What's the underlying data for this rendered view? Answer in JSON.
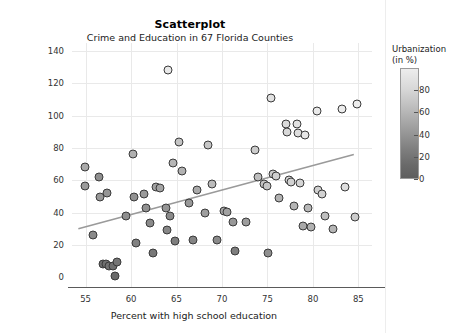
{
  "chart_data": {
    "type": "scatter",
    "title": "Scatterplot",
    "subtitle": "Crime and Education in 67 Florida Counties",
    "xlabel": "Percent with high school education",
    "ylabel": "Crimes per thousand",
    "xlim": [
      53.5,
      86.5
    ],
    "ylim": [
      -6,
      145
    ],
    "xticks": [
      55,
      60,
      65,
      70,
      75,
      80,
      85
    ],
    "yticks": [
      0,
      20,
      40,
      60,
      80,
      100,
      120,
      140
    ],
    "grid": true,
    "legend": {
      "title_line1": "Urbanization",
      "title_line2": "(in %)",
      "position": "right",
      "type": "colorbar",
      "ticks": [
        0,
        20,
        40,
        60,
        80
      ],
      "vmin": 0,
      "vmax": 100,
      "low_color": "#5e5e5e",
      "high_color": "#ededed"
    },
    "fit_line": {
      "x": [
        54.2,
        84.5
      ],
      "y": [
        30.0,
        76.0
      ],
      "color": "#9a9a9a"
    },
    "point_color_variable": "urbanization",
    "points": [
      {
        "x": 54.9,
        "y": 68.0,
        "u": 52
      },
      {
        "x": 54.9,
        "y": 56.5,
        "u": 42
      },
      {
        "x": 55.8,
        "y": 26.0,
        "u": 30
      },
      {
        "x": 56.5,
        "y": 62.0,
        "u": 34
      },
      {
        "x": 56.6,
        "y": 50.0,
        "u": 40
      },
      {
        "x": 56.9,
        "y": 8.0,
        "u": 10
      },
      {
        "x": 57.2,
        "y": 8.0,
        "u": 12
      },
      {
        "x": 57.3,
        "y": 52.0,
        "u": 38
      },
      {
        "x": 57.6,
        "y": 7.0,
        "u": 14
      },
      {
        "x": 58.0,
        "y": 7.0,
        "u": 12
      },
      {
        "x": 58.2,
        "y": 1.0,
        "u": 8
      },
      {
        "x": 58.4,
        "y": 9.5,
        "u": 16
      },
      {
        "x": 59.4,
        "y": 38.0,
        "u": 34
      },
      {
        "x": 60.2,
        "y": 76.0,
        "u": 56
      },
      {
        "x": 60.3,
        "y": 50.0,
        "u": 36
      },
      {
        "x": 60.5,
        "y": 21.0,
        "u": 24
      },
      {
        "x": 61.4,
        "y": 51.5,
        "u": 42
      },
      {
        "x": 61.6,
        "y": 43.0,
        "u": 35
      },
      {
        "x": 62.1,
        "y": 33.5,
        "u": 30
      },
      {
        "x": 62.4,
        "y": 15.0,
        "u": 18
      },
      {
        "x": 62.7,
        "y": 56.0,
        "u": 46
      },
      {
        "x": 63.2,
        "y": 55.5,
        "u": 48
      },
      {
        "x": 63.8,
        "y": 43.0,
        "u": 38
      },
      {
        "x": 63.9,
        "y": 29.0,
        "u": 28
      },
      {
        "x": 64.1,
        "y": 128.0,
        "u": 96
      },
      {
        "x": 64.3,
        "y": 38.0,
        "u": 30
      },
      {
        "x": 64.6,
        "y": 71.0,
        "u": 60
      },
      {
        "x": 64.8,
        "y": 22.5,
        "u": 22
      },
      {
        "x": 65.3,
        "y": 84.0,
        "u": 70
      },
      {
        "x": 65.6,
        "y": 66.0,
        "u": 58
      },
      {
        "x": 66.4,
        "y": 46.0,
        "u": 40
      },
      {
        "x": 66.8,
        "y": 23.0,
        "u": 26
      },
      {
        "x": 67.3,
        "y": 54.0,
        "u": 52
      },
      {
        "x": 68.1,
        "y": 40.0,
        "u": 44
      },
      {
        "x": 68.5,
        "y": 82.0,
        "u": 72
      },
      {
        "x": 68.9,
        "y": 58.0,
        "u": 64
      },
      {
        "x": 69.5,
        "y": 23.0,
        "u": 30
      },
      {
        "x": 70.2,
        "y": 41.0,
        "u": 48
      },
      {
        "x": 70.6,
        "y": 40.5,
        "u": 46
      },
      {
        "x": 71.2,
        "y": 34.0,
        "u": 40
      },
      {
        "x": 71.4,
        "y": 16.0,
        "u": 22
      },
      {
        "x": 72.6,
        "y": 34.5,
        "u": 44
      },
      {
        "x": 73.6,
        "y": 78.5,
        "u": 76
      },
      {
        "x": 74.0,
        "y": 62.0,
        "u": 66
      },
      {
        "x": 74.6,
        "y": 58.0,
        "u": 70
      },
      {
        "x": 74.9,
        "y": 56.5,
        "u": 72
      },
      {
        "x": 75.1,
        "y": 15.0,
        "u": 34
      },
      {
        "x": 75.4,
        "y": 111.0,
        "u": 90
      },
      {
        "x": 75.6,
        "y": 64.0,
        "u": 74
      },
      {
        "x": 75.9,
        "y": 63.0,
        "u": 78
      },
      {
        "x": 76.3,
        "y": 49.0,
        "u": 58
      },
      {
        "x": 77.0,
        "y": 95.0,
        "u": 86
      },
      {
        "x": 77.1,
        "y": 90.0,
        "u": 84
      },
      {
        "x": 77.4,
        "y": 60.5,
        "u": 80
      },
      {
        "x": 77.6,
        "y": 59.0,
        "u": 80
      },
      {
        "x": 77.9,
        "y": 44.0,
        "u": 60
      },
      {
        "x": 78.3,
        "y": 95.0,
        "u": 92
      },
      {
        "x": 78.4,
        "y": 89.0,
        "u": 88
      },
      {
        "x": 78.6,
        "y": 58.5,
        "u": 82
      },
      {
        "x": 78.9,
        "y": 32.0,
        "u": 52
      },
      {
        "x": 79.1,
        "y": 88.0,
        "u": 94
      },
      {
        "x": 79.5,
        "y": 43.0,
        "u": 62
      },
      {
        "x": 79.8,
        "y": 31.0,
        "u": 58
      },
      {
        "x": 80.4,
        "y": 103.0,
        "u": 96
      },
      {
        "x": 80.6,
        "y": 54.0,
        "u": 78
      },
      {
        "x": 81.0,
        "y": 51.5,
        "u": 80
      },
      {
        "x": 81.3,
        "y": 38.0,
        "u": 66
      },
      {
        "x": 82.2,
        "y": 30.0,
        "u": 60
      },
      {
        "x": 83.2,
        "y": 104.0,
        "u": 98
      },
      {
        "x": 83.5,
        "y": 56.0,
        "u": 88
      },
      {
        "x": 84.9,
        "y": 107.0,
        "u": 99
      },
      {
        "x": 84.6,
        "y": 37.5,
        "u": 76
      }
    ]
  }
}
